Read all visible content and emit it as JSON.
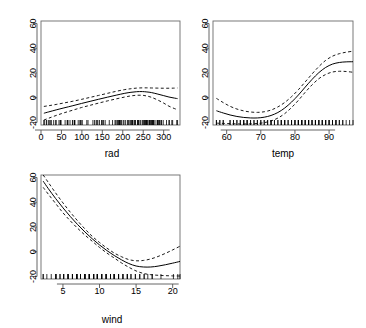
{
  "figure": {
    "kind": "r-gam-smooth-panels",
    "background": "#ffffff",
    "line_color": "#000000",
    "panel_count": 3,
    "labels": {
      "rad": "rad",
      "temp": "temp",
      "wind": "wind"
    }
  },
  "chart_data": [
    {
      "type": "line",
      "title": "",
      "xlabel": "rad",
      "ylabel": "",
      "xlim": [
        0,
        340
      ],
      "ylim": [
        -22,
        62
      ],
      "xticks": [
        0,
        50,
        100,
        150,
        200,
        250,
        300
      ],
      "xticklabels": [
        "0",
        "50",
        "100",
        "150",
        "200",
        "250",
        "300"
      ],
      "yticks": [
        -20,
        0,
        20,
        40,
        60
      ],
      "yticklabels": [
        "-20",
        "0",
        "20",
        "40",
        "60"
      ],
      "grid": false,
      "legend": "none",
      "rug": true,
      "series": [
        {
          "name": "fit",
          "style": "solid",
          "x": [
            7,
            19,
            37,
            56,
            78,
            99,
            120,
            141,
            163,
            184,
            205,
            220,
            234,
            248,
            259,
            270,
            284,
            299,
            313,
            327,
            334
          ],
          "values": [
            -12.5,
            -11.4,
            -9.8,
            -8.2,
            -6.4,
            -4.6,
            -2.9,
            -1.2,
            0.5,
            2.1,
            3.6,
            4.4,
            4.9,
            5.0,
            4.7,
            4.2,
            3.1,
            1.8,
            0.6,
            -0.3,
            -0.7
          ]
        },
        {
          "name": "upper-ci",
          "style": "dashed",
          "x": [
            7,
            19,
            37,
            56,
            78,
            99,
            120,
            141,
            163,
            184,
            205,
            220,
            234,
            248,
            259,
            270,
            284,
            299,
            313,
            327,
            334
          ],
          "values": [
            -7.0,
            -6.4,
            -5.4,
            -4.2,
            -2.8,
            -1.3,
            0.3,
            1.9,
            3.6,
            5.2,
            6.6,
            7.3,
            7.8,
            8.0,
            8.0,
            7.9,
            7.8,
            7.7,
            7.7,
            7.8,
            7.9
          ]
        },
        {
          "name": "lower-ci",
          "style": "dashed",
          "x": [
            7,
            19,
            37,
            56,
            78,
            99,
            120,
            141,
            163,
            184,
            205,
            220,
            234,
            248,
            259,
            270,
            284,
            299,
            313,
            327,
            334
          ],
          "values": [
            -18.0,
            -16.5,
            -14.3,
            -12.2,
            -10.0,
            -7.9,
            -6.1,
            -4.3,
            -2.5,
            -0.9,
            0.6,
            1.5,
            2.0,
            2.0,
            1.4,
            0.4,
            -1.6,
            -4.1,
            -6.8,
            -8.8,
            -9.6
          ]
        }
      ],
      "rug_values": [
        7,
        8,
        13,
        14,
        19,
        20,
        24,
        25,
        31,
        36,
        37,
        44,
        47,
        48,
        49,
        59,
        64,
        65,
        66,
        71,
        77,
        78,
        82,
        82,
        83,
        91,
        95,
        97,
        98,
        101,
        112,
        115,
        127,
        131,
        135,
        137,
        139,
        143,
        148,
        150,
        153,
        157,
        167,
        175,
        181,
        183,
        186,
        188,
        189,
        191,
        192,
        193,
        194,
        197,
        201,
        203,
        207,
        212,
        213,
        215,
        218,
        220,
        222,
        223,
        224,
        225,
        229,
        230,
        231,
        236,
        237,
        238,
        238,
        242,
        244,
        248,
        250,
        252,
        253,
        255,
        256,
        258,
        259,
        259,
        260,
        264,
        265,
        266,
        267,
        269,
        270,
        272,
        273,
        274,
        275,
        276,
        279,
        284,
        285,
        286,
        287,
        290,
        291,
        294,
        295,
        299,
        307,
        313,
        314,
        320,
        322,
        332,
        334
      ],
      "n_rug": 113
    },
    {
      "type": "line",
      "title": "",
      "xlabel": "temp",
      "ylabel": "",
      "xlim": [
        56,
        97
      ],
      "ylim": [
        -22,
        62
      ],
      "xticks": [
        60,
        70,
        80,
        90
      ],
      "xticklabels": [
        "60",
        "70",
        "80",
        "90"
      ],
      "yticks": [
        -20,
        0,
        20,
        40,
        60
      ],
      "yticklabels": [
        "-20",
        "0",
        "20",
        "40",
        "60"
      ],
      "grid": false,
      "legend": "none",
      "rug": true,
      "series": [
        {
          "name": "fit",
          "style": "solid",
          "x": [
            57,
            59,
            61,
            63,
            65,
            67,
            69,
            71,
            73,
            75,
            77,
            79,
            81,
            83,
            85,
            87,
            89,
            91,
            93,
            95,
            97
          ],
          "values": [
            -10.5,
            -12.3,
            -13.9,
            -15.1,
            -15.9,
            -16.3,
            -16.3,
            -15.7,
            -14.3,
            -11.9,
            -8.3,
            -3.5,
            2.2,
            8.6,
            14.8,
            20.3,
            24.5,
            27.2,
            28.5,
            29.0,
            29.1
          ]
        },
        {
          "name": "upper-ci",
          "style": "dashed",
          "x": [
            57,
            59,
            61,
            63,
            65,
            67,
            69,
            71,
            73,
            75,
            77,
            79,
            81,
            83,
            85,
            87,
            89,
            91,
            93,
            95,
            97
          ],
          "values": [
            -0.5,
            -3.9,
            -6.9,
            -9.1,
            -10.6,
            -11.5,
            -11.8,
            -11.3,
            -9.9,
            -7.4,
            -3.8,
            0.9,
            6.5,
            12.8,
            19.2,
            25.2,
            30.2,
            33.6,
            35.6,
            36.8,
            37.6
          ]
        },
        {
          "name": "lower-ci",
          "style": "dashed",
          "x": [
            57,
            59,
            61,
            63,
            65,
            67,
            69,
            71,
            73,
            75,
            77,
            79,
            81,
            83,
            85,
            87,
            89,
            91,
            93,
            95,
            97
          ],
          "values": [
            -20.5,
            -20.7,
            -20.9,
            -21.1,
            -21.2,
            -21.1,
            -20.8,
            -20.1,
            -18.7,
            -16.4,
            -12.8,
            -7.9,
            -2.1,
            4.4,
            10.4,
            15.4,
            18.8,
            20.8,
            21.4,
            21.2,
            20.6
          ]
        }
      ],
      "rug_values": [
        57,
        57,
        58,
        58,
        59,
        59,
        61,
        61,
        62,
        62,
        63,
        63,
        64,
        64,
        65,
        65,
        65,
        66,
        66,
        66,
        67,
        67,
        68,
        68,
        69,
        69,
        70,
        70,
        71,
        71,
        72,
        72,
        73,
        73,
        73,
        74,
        74,
        75,
        75,
        76,
        76,
        76,
        77,
        77,
        77,
        78,
        78,
        79,
        79,
        79,
        80,
        80,
        80,
        81,
        81,
        81,
        81,
        82,
        82,
        82,
        82,
        83,
        83,
        83,
        84,
        84,
        84,
        84,
        85,
        85,
        85,
        86,
        86,
        86,
        86,
        87,
        87,
        87,
        88,
        88,
        88,
        89,
        89,
        89,
        90,
        90,
        90,
        91,
        91,
        91,
        92,
        92,
        92,
        93,
        93,
        94,
        94,
        95,
        96,
        97
      ],
      "n_rug": 100
    },
    {
      "type": "line",
      "title": "",
      "xlabel": "wind",
      "ylabel": "",
      "xlim": [
        2.0,
        21.0
      ],
      "ylim": [
        -22,
        62
      ],
      "xticks": [
        5,
        10,
        15,
        20
      ],
      "xticklabels": [
        "5",
        "10",
        "15",
        "20"
      ],
      "yticks": [
        -20,
        0,
        20,
        40,
        60
      ],
      "yticklabels": [
        "-20",
        "0",
        "20",
        "40",
        "60"
      ],
      "grid": false,
      "legend": "none",
      "rug": true,
      "series": [
        {
          "name": "fit",
          "style": "solid",
          "x": [
            2.3,
            3.0,
            4.0,
            5.0,
            6.0,
            7.0,
            8.0,
            9.0,
            10.0,
            11.0,
            12.0,
            13.0,
            14.0,
            15.0,
            16.0,
            17.0,
            18.0,
            19.0,
            20.0,
            21.0
          ],
          "values": [
            57.0,
            51.0,
            43.0,
            35.5,
            28.5,
            22.0,
            16.0,
            10.5,
            5.5,
            1.0,
            -3.0,
            -6.5,
            -9.5,
            -11.5,
            -12.3,
            -12.3,
            -11.6,
            -10.5,
            -9.2,
            -7.8
          ]
        },
        {
          "name": "upper-ci",
          "style": "dashed",
          "x": [
            2.3,
            3.0,
            4.0,
            5.0,
            6.0,
            7.0,
            8.0,
            9.0,
            10.0,
            11.0,
            12.0,
            13.0,
            14.0,
            15.0,
            16.0,
            17.0,
            18.0,
            19.0,
            20.0,
            21.0
          ],
          "values": [
            62.0,
            56.0,
            47.5,
            39.5,
            32.0,
            25.0,
            18.5,
            12.5,
            7.5,
            3.0,
            -1.0,
            -4.0,
            -6.3,
            -7.3,
            -7.0,
            -5.8,
            -3.8,
            -1.3,
            1.5,
            4.5
          ]
        },
        {
          "name": "lower-ci",
          "style": "dashed",
          "x": [
            2.3,
            3.0,
            4.0,
            5.0,
            6.0,
            7.0,
            8.0,
            9.0,
            10.0,
            11.0,
            12.0,
            13.0,
            14.0,
            15.0,
            16.0,
            17.0,
            18.0,
            19.0,
            20.0,
            21.0
          ],
          "values": [
            52.0,
            46.5,
            39.0,
            31.5,
            25.0,
            19.0,
            13.5,
            8.5,
            3.5,
            -1.0,
            -5.0,
            -9.0,
            -12.5,
            -15.5,
            -17.5,
            -18.5,
            -19.0,
            -19.3,
            -19.5,
            -19.6
          ]
        }
      ],
      "rug_values": [
        2.3,
        2.3,
        2.8,
        3.4,
        4.0,
        4.0,
        4.1,
        4.6,
        4.6,
        5.1,
        5.1,
        5.1,
        5.7,
        5.7,
        5.7,
        5.7,
        6.3,
        6.3,
        6.3,
        6.3,
        6.9,
        6.9,
        6.9,
        6.9,
        6.9,
        7.4,
        7.4,
        7.4,
        8.0,
        8.0,
        8.0,
        8.0,
        8.0,
        8.6,
        8.6,
        8.6,
        8.6,
        8.6,
        9.2,
        9.2,
        9.2,
        9.2,
        9.7,
        9.7,
        9.7,
        9.7,
        9.7,
        10.3,
        10.3,
        10.3,
        10.3,
        10.9,
        10.9,
        10.9,
        10.9,
        11.5,
        11.5,
        11.5,
        11.5,
        11.5,
        12.0,
        12.0,
        12.0,
        12.0,
        12.6,
        12.6,
        12.6,
        12.6,
        13.2,
        13.2,
        13.2,
        13.8,
        13.8,
        13.8,
        14.3,
        14.3,
        14.9,
        14.9,
        15.5,
        15.5,
        16.1,
        16.1,
        16.6,
        17.2,
        17.2,
        18.4,
        20.1,
        20.7,
        21.0
      ],
      "n_rug": 89
    }
  ]
}
